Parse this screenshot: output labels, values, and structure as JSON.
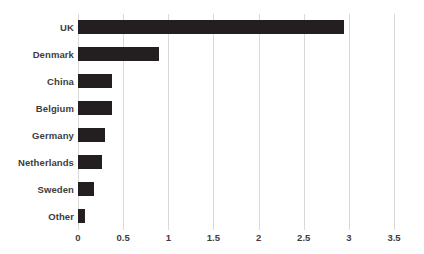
{
  "chart_data": {
    "type": "bar",
    "orientation": "horizontal",
    "title": "",
    "subtitle": "",
    "xlabel": "",
    "ylabel": "",
    "categories": [
      "UK",
      "Denmark",
      "China",
      "Belgium",
      "Germany",
      "Netherlands",
      "Sweden",
      "Other"
    ],
    "values": [
      2.95,
      0.9,
      0.38,
      0.38,
      0.3,
      0.27,
      0.18,
      0.08
    ],
    "series": [
      {
        "name": "Value",
        "values": [
          2.95,
          0.9,
          0.38,
          0.38,
          0.3,
          0.27,
          0.18,
          0.08
        ]
      }
    ],
    "xlim": [
      0,
      3.5
    ],
    "x_ticks": [
      0,
      0.5,
      1,
      1.5,
      2,
      2.5,
      3,
      3.5
    ],
    "x_tick_labels": [
      "0",
      "0.5",
      "1",
      "1.5",
      "2",
      "2.5",
      "3",
      "3.5"
    ],
    "grid": "vertical",
    "legend": "none",
    "bar_color": "#231f20",
    "gridline_color": "#d9d9d9",
    "label_color": "#3d3d3d",
    "background_color": "#ffffff"
  }
}
